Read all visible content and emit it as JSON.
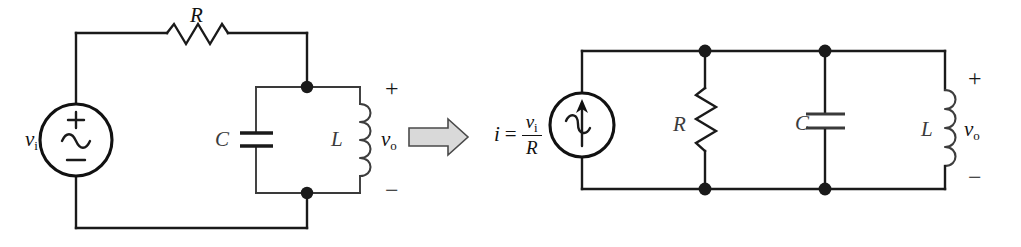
{
  "figure": {
    "background_color": "#ffffff",
    "wire_color": "#1a1a1a",
    "arrow_fill_color": "#d9d9d9",
    "arrow_outline_color": "#4a4a4a"
  },
  "left_circuit": {
    "name": "series-voltage-source-rlc-circuit",
    "source": {
      "type": "ac-voltage-source",
      "label_var": "v",
      "label_sub": "i",
      "plus_sign": "+",
      "wave_sign": "~",
      "minus_sign": "−"
    },
    "resistor": {
      "label": "R",
      "orientation": "horizontal"
    },
    "capacitor": {
      "label": "C",
      "orientation": "vertical"
    },
    "inductor": {
      "label": "L",
      "orientation": "vertical"
    },
    "output": {
      "label_var": "v",
      "label_sub": "o",
      "plus_sign": "+",
      "minus_sign": "−"
    }
  },
  "transform_arrow": {
    "name": "transformation-arrow",
    "direction": "right",
    "symbol": "⇒"
  },
  "right_circuit": {
    "name": "parallel-current-source-rlc-circuit",
    "source": {
      "type": "ac-current-source",
      "equation": {
        "lhs": "i",
        "operator": "=",
        "numerator_var": "v",
        "numerator_sub": "i",
        "denominator": "R"
      }
    },
    "resistor": {
      "label": "R",
      "orientation": "vertical"
    },
    "capacitor": {
      "label": "C",
      "orientation": "vertical"
    },
    "inductor": {
      "label": "L",
      "orientation": "vertical"
    },
    "output": {
      "label_var": "v",
      "label_sub": "o",
      "plus_sign": "+",
      "minus_sign": "−"
    }
  }
}
